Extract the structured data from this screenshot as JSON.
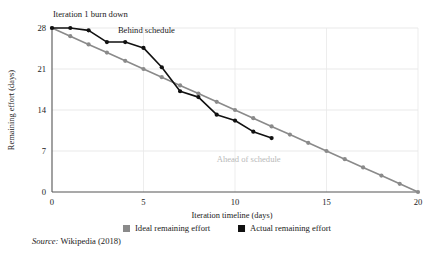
{
  "chart_data": {
    "type": "line",
    "title": "Iteration 1 burn down",
    "xlabel": "Iteration timeline (days)",
    "ylabel": "Remaining effort (days)",
    "xlim": [
      0,
      20
    ],
    "ylim": [
      0,
      28
    ],
    "xticks": [
      0,
      5,
      10,
      15,
      20
    ],
    "xtick_labels": [
      "0",
      "5",
      "10",
      "15",
      "20"
    ],
    "yticks": [
      0,
      7,
      14,
      21,
      28
    ],
    "ytick_labels": [
      "0",
      "7",
      "14",
      "21",
      "28"
    ],
    "grid": "horizontal and vertical light gridlines at ticks",
    "legend_position": "below axis, centered",
    "series": [
      {
        "name": "Ideal remaining effort",
        "color": "#8a8a8a",
        "marker": "circle",
        "x": [
          0,
          1,
          2,
          3,
          4,
          5,
          6,
          7,
          8,
          9,
          10,
          11,
          12,
          13,
          14,
          15,
          16,
          17,
          18,
          19,
          20
        ],
        "values": [
          28.0,
          26.6,
          25.2,
          23.8,
          22.4,
          21.0,
          19.6,
          18.2,
          16.8,
          15.4,
          14.0,
          12.6,
          11.2,
          9.8,
          8.4,
          7.0,
          5.6,
          4.2,
          2.8,
          1.4,
          0.0
        ]
      },
      {
        "name": "Actual remaining effort",
        "color": "#111111",
        "marker": "circle",
        "x": [
          0,
          1,
          2,
          3,
          4,
          5,
          6,
          7,
          8,
          9,
          10,
          11,
          12
        ],
        "values": [
          28.0,
          28.0,
          27.6,
          25.6,
          25.6,
          24.6,
          21.3,
          17.2,
          16.2,
          13.2,
          12.2,
          10.3,
          9.2
        ]
      }
    ],
    "annotations": [
      {
        "text": "Behind schedule",
        "x": 3.6,
        "y": 27.2,
        "color": "#1a1a1a"
      },
      {
        "text": "Ahead of schedule",
        "x": 9.0,
        "y": 5.2,
        "color": "#b9b9b9"
      }
    ]
  },
  "legend": {
    "items": [
      {
        "label": "Ideal remaining effort",
        "color": "#8a8a8a"
      },
      {
        "label": "Actual remaining effort",
        "color": "#111111"
      }
    ]
  },
  "source": {
    "keyword": "Source:",
    "text": "Wikipedia (2018)"
  }
}
